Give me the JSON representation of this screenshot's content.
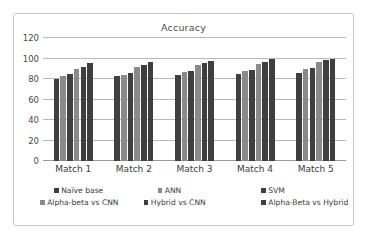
{
  "chart_data": {
    "type": "bar",
    "title": "Accuracy",
    "xlabel": "",
    "ylabel": "",
    "ylim": [
      0,
      120
    ],
    "yticks": [
      0,
      20,
      40,
      60,
      80,
      100,
      120
    ],
    "ytick_labels": [
      "0",
      "20",
      "40",
      "60",
      "80",
      "100",
      "120"
    ],
    "grid": true,
    "legend_position": "bottom",
    "categories": [
      "Match 1",
      "Match 2",
      "Match 3",
      "Match 4",
      "Match 5"
    ],
    "series": [
      {
        "name": "Naïve base",
        "color": "#3f3f3f",
        "values": [
          80,
          83,
          84,
          85,
          86
        ]
      },
      {
        "name": "ANN",
        "color": "#8a8a8a",
        "values": [
          83,
          84,
          87,
          88,
          90
        ]
      },
      {
        "name": "SVM",
        "color": "#3f3f3f",
        "values": [
          85,
          86,
          88,
          89,
          91
        ]
      },
      {
        "name": "Alpha-beta vs CNN",
        "color": "#8a8a8a",
        "values": [
          90,
          92,
          94,
          95,
          97
        ]
      },
      {
        "name": "Hybrid vs CNN",
        "color": "#3f3f3f",
        "values": [
          92,
          94,
          96,
          97,
          99
        ]
      },
      {
        "name": "Alpha-Beta vs Hybrid",
        "color": "#3f3f3f",
        "values": [
          96,
          97,
          98,
          100,
          100
        ]
      }
    ]
  },
  "colors": {
    "dark_bar": "#3f3f3f",
    "light_bar": "#8a8a8a",
    "gridline": "#b9b9b9",
    "border": "#c8c8c8",
    "text": "#3c3c3c",
    "background": "#ffffff"
  }
}
